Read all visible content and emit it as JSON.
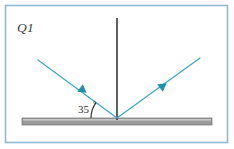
{
  "figure": {
    "title_label": "Q1",
    "angle_label": "35",
    "degree_symbol": "°",
    "width": 234,
    "height": 149
  },
  "colors": {
    "border": "#8fb9d4",
    "background": "#ffffff",
    "ray": "#3aa8c1",
    "arrowhead": "#1f8fab",
    "normal_line": "#2b2b2b",
    "mirror_body": "#9a9a9a",
    "mirror_highlight": "#c8c8c8",
    "mirror_outline": "#6f6f6f",
    "text": "#3b3b44",
    "angle_arc": "#2b2b2b"
  },
  "geometry": {
    "border_rect": {
      "x": 5.5,
      "y": 5.5,
      "width": 222,
      "height": 137
    },
    "vertex": {
      "x": 117,
      "y": 118
    },
    "normal_top": {
      "x": 117,
      "y": 18
    },
    "normal_bottom": {
      "x": 117,
      "y": 120
    },
    "incident_start": {
      "x": 38,
      "y": 60
    },
    "reflected_end": {
      "x": 200,
      "y": 58
    },
    "mirror": {
      "x": 22,
      "y": 118,
      "width": 190,
      "height": 7
    },
    "incident_arrow_at": {
      "x": 80,
      "y": 88
    },
    "reflected_arrow_at": {
      "x": 160,
      "y": 88
    },
    "arc_radius": 26,
    "angle_label_pos": {
      "x": 78,
      "y": 113
    },
    "degree_pos": {
      "x": 93,
      "y": 107
    },
    "q_label_pos": {
      "x": 17,
      "y": 32
    }
  },
  "semantics": {
    "diagram_type": "ray-reflection",
    "incident_ray_name": "incident-ray",
    "reflected_ray_name": "reflected-ray",
    "normal_name": "normal-line",
    "mirror_name": "mirror-surface",
    "angle_name": "angle-of-incidence"
  }
}
